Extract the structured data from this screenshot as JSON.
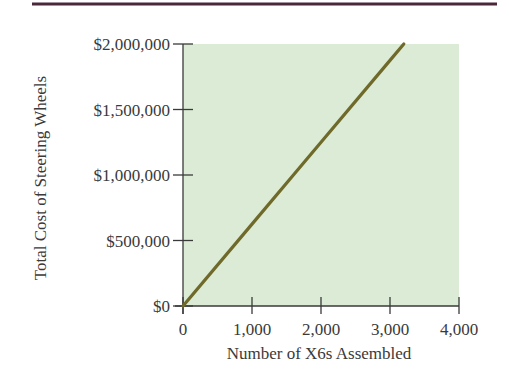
{
  "colors": {
    "top_rule": "#4a2838",
    "plot_background": "#dcebd5",
    "axis": "#3a3a3a",
    "series_line": "#6f6a2a",
    "text": "#3a3a3a"
  },
  "chart_data": {
    "type": "line",
    "title": "",
    "xlabel": "Number of X6s Assembled",
    "ylabel": "Total Cost of Steering Wheels",
    "xlim": [
      0,
      4000
    ],
    "ylim": [
      0,
      2000000
    ],
    "x_ticks": [
      0,
      1000,
      2000,
      3000,
      4000
    ],
    "x_tick_labels": [
      "0",
      "1,000",
      "2,000",
      "3,000",
      "4,000"
    ],
    "y_ticks": [
      0,
      500000,
      1000000,
      1500000,
      2000000
    ],
    "y_tick_labels": [
      "$0",
      "$500,000",
      "$1,000,000",
      "$1,500,000",
      "$2,000,000"
    ],
    "grid": false,
    "legend": null,
    "series": [
      {
        "name": "Total Cost of Steering Wheels",
        "x": [
          0,
          1000,
          1600,
          2000,
          3000,
          3200
        ],
        "y": [
          0,
          625000,
          1000000,
          1250000,
          1875000,
          2000000
        ]
      }
    ]
  }
}
